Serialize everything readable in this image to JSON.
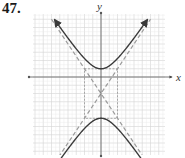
{
  "problem": {
    "number": "47."
  },
  "chart_data": {
    "type": "line",
    "title": "",
    "xlabel": "x",
    "ylabel": "y",
    "xlim": [
      -8,
      8
    ],
    "ylim": [
      -9.5,
      7.5
    ],
    "grid": true,
    "grid_step": 1,
    "hyperbola": {
      "orientation": "vertical",
      "center": [
        0,
        -2
      ],
      "a": 3,
      "b": 2,
      "vertices": [
        [
          0,
          1
        ],
        [
          0,
          -5
        ]
      ],
      "equation": "(y+2)^2/9 - x^2/4 = 1"
    },
    "asymptotes": [
      {
        "slope": 1.5,
        "intercept": -2,
        "style": "dashed"
      },
      {
        "slope": -1.5,
        "intercept": -2,
        "style": "dashed"
      }
    ],
    "rectangle": {
      "x": [
        -2,
        2
      ],
      "y": [
        -5,
        1
      ],
      "style": "dashed"
    },
    "series": [
      {
        "name": "upper branch",
        "style": "solid",
        "arrows": "both"
      },
      {
        "name": "lower branch",
        "style": "solid",
        "arrows": "both"
      }
    ]
  },
  "colors": {
    "grid": "#d4d4d4",
    "axis": "#555555",
    "curve": "#3a3a3a",
    "asymptote": "#9a9a9a",
    "rectangle": "#8a8a8a"
  },
  "labels": {
    "x_axis": "x",
    "y_axis": "y"
  }
}
